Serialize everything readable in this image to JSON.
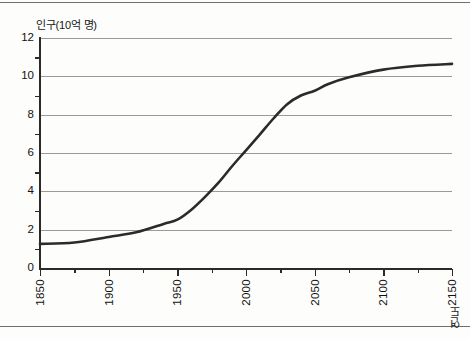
{
  "chart_data": {
    "type": "line",
    "title": "",
    "ylabel": "인구(10억 명)",
    "xlabel": "연도",
    "xlim": [
      1850,
      2150
    ],
    "ylim": [
      0,
      12
    ],
    "grid": true,
    "legend": "none",
    "line_color": "#2b2b2b",
    "line_width": 2.6,
    "y_ticks": [
      0,
      2,
      4,
      6,
      8,
      10,
      12
    ],
    "y_tick_labels": [
      "0",
      "2",
      "4",
      "6",
      "8",
      "10",
      "12"
    ],
    "y_minor_ticks": [
      1,
      3,
      5,
      7,
      9,
      11
    ],
    "x_ticks": [
      1850,
      1900,
      1950,
      2000,
      2050,
      2100,
      2150
    ],
    "x_tick_labels": [
      "1850",
      "1900",
      "1950",
      "2000",
      "2050",
      "2100",
      "2150"
    ],
    "x_minor_ticks": [
      1875,
      1925,
      1975,
      2025,
      2075,
      2125
    ],
    "series": [
      {
        "name": "세계 인구",
        "x": [
          1850,
          1875,
          1900,
          1920,
          1940,
          1950,
          1960,
          1970,
          1980,
          1990,
          2000,
          2010,
          2020,
          2030,
          2040,
          2050,
          2060,
          2075,
          2100,
          2125,
          2150
        ],
        "values": [
          1.26,
          1.33,
          1.62,
          1.86,
          2.3,
          2.52,
          3.03,
          3.7,
          4.45,
          5.32,
          6.14,
          6.96,
          7.8,
          8.55,
          9.0,
          9.25,
          9.6,
          9.95,
          10.35,
          10.55,
          10.65
        ]
      }
    ]
  },
  "frame": {
    "top_rule": "divider",
    "bottom_rule": "divider"
  }
}
